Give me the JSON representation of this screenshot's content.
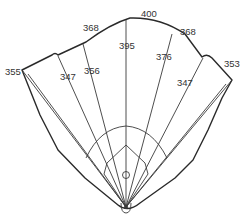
{
  "diagram": {
    "type": "baseball-field-dimensions",
    "colors": {
      "line": "#2a2a2a",
      "text": "#333333",
      "background": "#ffffff"
    },
    "distances": [
      {
        "id": "left-field-line",
        "label": "355"
      },
      {
        "id": "left-field",
        "label": "347"
      },
      {
        "id": "left-center-fence",
        "label": "368"
      },
      {
        "id": "left-center",
        "label": "356"
      },
      {
        "id": "center-deep",
        "label": "400"
      },
      {
        "id": "center",
        "label": "395"
      },
      {
        "id": "right-center",
        "label": "376"
      },
      {
        "id": "right-center-fence",
        "label": "368"
      },
      {
        "id": "right-field",
        "label": "347"
      },
      {
        "id": "right-field-line",
        "label": "353"
      }
    ]
  }
}
